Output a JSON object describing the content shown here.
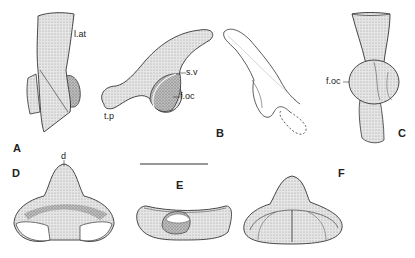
{
  "figure": {
    "panels": [
      {
        "id": "A",
        "label": "A"
      },
      {
        "id": "B",
        "label": "B"
      },
      {
        "id": "C",
        "label": "C"
      },
      {
        "id": "D",
        "label": "D"
      },
      {
        "id": "E",
        "label": "E"
      },
      {
        "id": "F",
        "label": "F"
      }
    ],
    "annotations": {
      "l_at": "l.at",
      "t_p": "t.p",
      "s_v": "s.v",
      "f_oc_b": "f.oc",
      "f_oc_c": "f.oc",
      "d": "d"
    },
    "scale_bar": {
      "visible": true
    }
  }
}
